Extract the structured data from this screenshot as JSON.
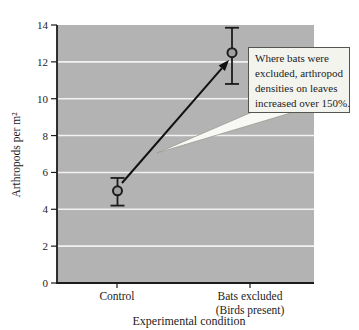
{
  "figure": {
    "background": "#ffffff",
    "plot_bg": "#b3b3b3",
    "gridline_color": "#f2f2f2",
    "axis_color": "#1c1c1c",
    "point_fill": "#a0a0a0",
    "point_stroke": "#1c1c1c",
    "arrow_color": "#111111",
    "annotation_bg": "#f4f4ef",
    "annotation_border": "#55544e"
  },
  "chart_data": {
    "type": "scatter",
    "title": "",
    "xlabel": "Experimental condition",
    "ylabel": "Arthropods per m²",
    "ylim": [
      0,
      14
    ],
    "yticks": [
      0,
      2,
      4,
      6,
      8,
      10,
      12,
      14
    ],
    "grid": "horizontal-white-on-gray",
    "legend": "none",
    "categories": [
      "Control",
      "Bats excluded (Birds present)"
    ],
    "category_labels": [
      [
        "Control"
      ],
      [
        "Bats excluded",
        "(Birds present)"
      ]
    ],
    "points": [
      {
        "category": "Control",
        "value": 5.0,
        "error_high": 0.7,
        "error_low": 0.8
      },
      {
        "category": "Bats excluded (Birds present)",
        "value": 12.5,
        "error_high": 1.35,
        "error_low": 1.7
      }
    ],
    "arrow": "from Control point up to Bats excluded point",
    "annotation": {
      "text": "Where bats were excluded, arthropod densities on leaves increased over 150%.",
      "lines": [
        "Where bats were",
        "excluded, arthropod",
        "densities on leaves",
        "increased over 150%."
      ]
    }
  }
}
